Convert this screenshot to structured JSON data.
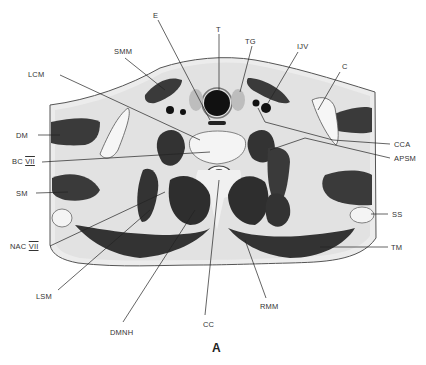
{
  "figure": {
    "panel_label": "A",
    "labels": [
      {
        "id": "E",
        "text": "E",
        "x": 154,
        "y": 14
      },
      {
        "id": "T",
        "text": "T",
        "x": 216,
        "y": 28
      },
      {
        "id": "TG",
        "text": "TG",
        "x": 246,
        "y": 40
      },
      {
        "id": "IJV",
        "text": "IJV",
        "x": 298,
        "y": 45
      },
      {
        "id": "SMM",
        "text": "SMM",
        "x": 115,
        "y": 45
      },
      {
        "id": "C",
        "text": "C",
        "x": 342,
        "y": 64
      },
      {
        "id": "LCM",
        "text": "LCM",
        "x": 27,
        "y": 70
      },
      {
        "id": "DM",
        "text": "DM",
        "x": 16,
        "y": 132
      },
      {
        "id": "CCA",
        "text": "CCA",
        "x": 395,
        "y": 141
      },
      {
        "id": "APSM",
        "text": "APSM",
        "x": 395,
        "y": 155
      },
      {
        "id": "BC",
        "text": "BC",
        "numeral": "VII",
        "x": 12,
        "y": 158
      },
      {
        "id": "SM",
        "text": "SM",
        "x": 16,
        "y": 190
      },
      {
        "id": "SS",
        "text": "SS",
        "x": 392,
        "y": 211
      },
      {
        "id": "NAC",
        "text": "NAC",
        "numeral": "VII",
        "x": 10,
        "y": 243
      },
      {
        "id": "TM",
        "text": "TM",
        "x": 392,
        "y": 244
      },
      {
        "id": "LSM",
        "text": "LSM",
        "x": 36,
        "y": 293
      },
      {
        "id": "RMM",
        "text": "RMM",
        "x": 260,
        "y": 303
      },
      {
        "id": "DMNH",
        "text": "DMNH",
        "x": 110,
        "y": 328
      },
      {
        "id": "CC",
        "text": "CC",
        "x": 203,
        "y": 322
      }
    ]
  }
}
